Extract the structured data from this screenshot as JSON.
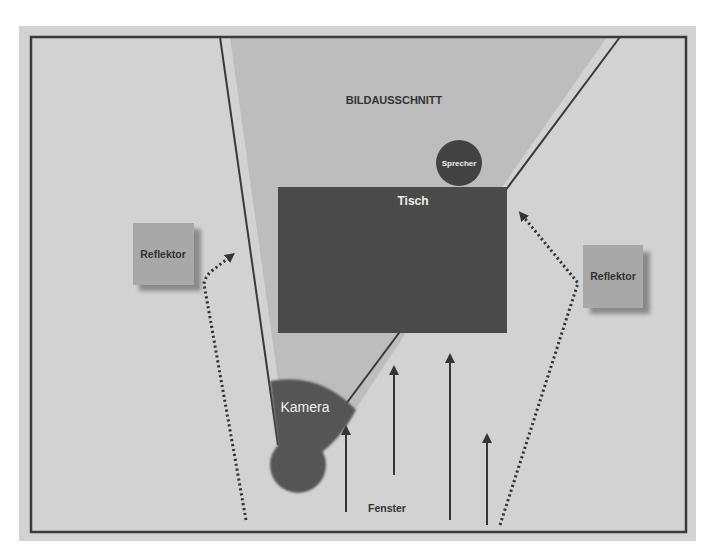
{
  "diagram": {
    "title_area": "BILDAUSSCHNITT",
    "labels": {
      "field_of_view": "BILDAUSSCHNITT",
      "speaker": "Sprecher",
      "table": "Tisch",
      "camera": "Kamera",
      "reflector_left": "Reflektor",
      "reflector_right": "Reflektor",
      "window": "Fenster"
    },
    "colors": {
      "page_bg": "#ffffff",
      "panel_bg": "#d2d2d2",
      "field_of_view": "#bdbdbd",
      "frame": "#3a3a3a",
      "table": "#4a4a4a",
      "speaker": "#424242",
      "camera": "#555555",
      "reflector": "#a8a8a8",
      "reflector_shadow": "#8a8a8a",
      "arrow": "#353535",
      "dotted": "#353535",
      "text_dark": "#333333",
      "text_light": "#f0f0f0"
    }
  }
}
